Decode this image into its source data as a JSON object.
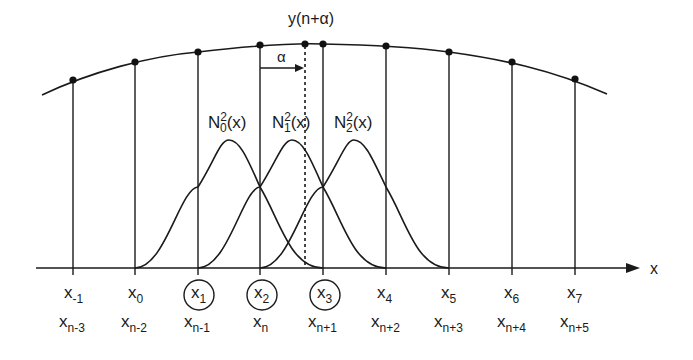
{
  "diagram": {
    "type": "b-spline-interpolation",
    "colors": {
      "stroke": "#1a1a1a",
      "background": "#ffffff"
    },
    "top_curve_label": {
      "base": "y(n+",
      "greek": "α",
      "close": ")"
    },
    "alpha_label": "α",
    "axis_label": "x",
    "basis_functions": [
      {
        "name": "N",
        "sub": "0",
        "sup": "2",
        "arg": "(x)"
      },
      {
        "name": "N",
        "sub": "1",
        "sup": "2",
        "arg": "(x)"
      },
      {
        "name": "N",
        "sub": "2",
        "sup": "2",
        "arg": "(x)"
      }
    ],
    "knots": [
      {
        "x": 73,
        "top": {
          "base": "x",
          "sub": "-1"
        },
        "bottom": {
          "base": "x",
          "sub": "n-3"
        },
        "circled": false
      },
      {
        "x": 135,
        "top": {
          "base": "x",
          "sub": "0"
        },
        "bottom": {
          "base": "x",
          "sub": "n-2"
        },
        "circled": false
      },
      {
        "x": 198,
        "top": {
          "base": "x",
          "sub": "1"
        },
        "bottom": {
          "base": "x",
          "sub": "n-1"
        },
        "circled": true
      },
      {
        "x": 260,
        "top": {
          "base": "x",
          "sub": "2"
        },
        "bottom": {
          "base": "x",
          "sub": "n"
        },
        "circled": true
      },
      {
        "x": 323,
        "top": {
          "base": "x",
          "sub": "3"
        },
        "bottom": {
          "base": "x",
          "sub": "n+1"
        },
        "circled": true
      },
      {
        "x": 386,
        "top": {
          "base": "x",
          "sub": "4"
        },
        "bottom": {
          "base": "x",
          "sub": "n+2"
        },
        "circled": false
      },
      {
        "x": 449,
        "top": {
          "base": "x",
          "sub": "5"
        },
        "bottom": {
          "base": "x",
          "sub": "n+3"
        },
        "circled": false
      },
      {
        "x": 512,
        "top": {
          "base": "x",
          "sub": "6"
        },
        "bottom": {
          "base": "x",
          "sub": "n+4"
        },
        "circled": false
      },
      {
        "x": 575,
        "top": {
          "base": "x",
          "sub": "7"
        },
        "bottom": {
          "base": "x",
          "sub": "n+5"
        },
        "circled": false
      }
    ]
  }
}
